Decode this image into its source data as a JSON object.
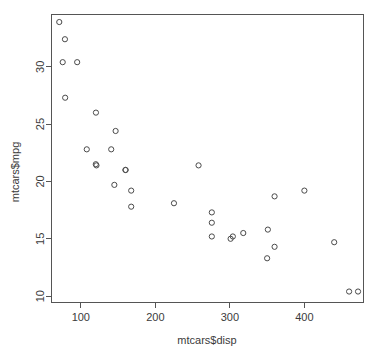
{
  "chart_data": {
    "type": "scatter",
    "title": "",
    "xlabel": "mtcars$disp",
    "ylabel": "mtcars$mpg",
    "xlim": [
      60,
      480
    ],
    "ylim": [
      9.4,
      34.6
    ],
    "grid": false,
    "legend": "none",
    "point_symbol": "open-circle",
    "point_color": "#4a4a4a",
    "xticks": [
      100,
      200,
      300,
      400
    ],
    "yticks": [
      10,
      15,
      20,
      25,
      30
    ],
    "xtick_labels": [
      "100",
      "200",
      "300",
      "400"
    ],
    "ytick_labels": [
      "10",
      "15",
      "20",
      "25",
      "30"
    ],
    "x": [
      160,
      160,
      108,
      258,
      360,
      225,
      360,
      146.7,
      140.8,
      167.6,
      167.6,
      275.8,
      275.8,
      275.8,
      472,
      460,
      440,
      78.7,
      75.7,
      71.1,
      120.1,
      318,
      304,
      350,
      400,
      79,
      120.3,
      95.1,
      351,
      145,
      301,
      121
    ],
    "y": [
      21,
      21,
      22.8,
      21.4,
      18.7,
      18.1,
      14.3,
      24.4,
      22.8,
      19.2,
      17.8,
      16.4,
      17.3,
      15.2,
      10.4,
      10.4,
      14.7,
      32.4,
      30.4,
      33.9,
      21.5,
      15.5,
      15.2,
      13.3,
      19.2,
      27.3,
      26,
      30.4,
      15.8,
      19.7,
      15,
      21.4
    ],
    "n_points": 32
  },
  "plot": {
    "box": {
      "left": 51,
      "top": 14,
      "right": 364,
      "bottom": 303
    }
  }
}
